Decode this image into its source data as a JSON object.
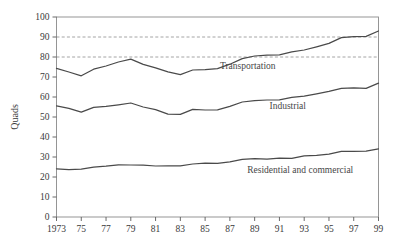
{
  "chart_data": {
    "type": "line",
    "title": "",
    "subtitle": "",
    "xlabel": "",
    "ylabel": "Quads",
    "xlim": [
      1973,
      1999
    ],
    "ylim": [
      0,
      100
    ],
    "grid": false,
    "legend_position": "inline-annotations",
    "x": [
      1973,
      1974,
      1975,
      1976,
      1977,
      1978,
      1979,
      1980,
      1981,
      1982,
      1983,
      1984,
      1985,
      1986,
      1987,
      1988,
      1989,
      1990,
      1991,
      1992,
      1993,
      1994,
      1995,
      1996,
      1997,
      1998,
      1999
    ],
    "x_tick_labels": [
      "1973",
      "75",
      "77",
      "79",
      "81",
      "83",
      "85",
      "87",
      "89",
      "91",
      "93",
      "95",
      "97",
      "99"
    ],
    "x_tick_values": [
      1973,
      1975,
      1977,
      1979,
      1981,
      1983,
      1985,
      1987,
      1989,
      1991,
      1993,
      1995,
      1997,
      1999
    ],
    "y_tick_labels": [
      "0",
      "10",
      "20",
      "30",
      "40",
      "50",
      "60",
      "70",
      "80",
      "90",
      "100"
    ],
    "y_tick_values": [
      0,
      10,
      20,
      30,
      40,
      50,
      60,
      70,
      80,
      90,
      100
    ],
    "series": [
      {
        "name": "Residential and commercial",
        "label": "Residential and commercial",
        "label_x": 1988.4,
        "label_y": 22.0,
        "color": "#4a4a4a",
        "values": [
          24.1,
          23.7,
          23.9,
          24.9,
          25.4,
          26.1,
          26.0,
          25.9,
          25.5,
          25.6,
          25.6,
          26.5,
          26.9,
          26.8,
          27.6,
          28.8,
          29.2,
          28.9,
          29.4,
          29.3,
          30.6,
          30.8,
          31.4,
          32.8,
          32.8,
          32.9,
          34.1
        ]
      },
      {
        "name": "Industrial",
        "label": "Industrial",
        "label_x": 1990.2,
        "label_y": 54.0,
        "color": "#4a4a4a",
        "values": [
          55.6,
          54.3,
          52.4,
          54.8,
          55.3,
          56.1,
          57.0,
          55.0,
          53.7,
          51.4,
          51.3,
          53.8,
          53.5,
          53.6,
          55.3,
          57.5,
          58.2,
          58.5,
          58.6,
          59.8,
          60.4,
          61.6,
          62.8,
          64.3,
          64.6,
          64.3,
          66.9
        ]
      },
      {
        "name": "Transportation",
        "label": "Transportation",
        "label_x": 1986.2,
        "label_y": 74.0,
        "color": "#4a4a4a",
        "values": [
          74.3,
          72.5,
          70.6,
          73.9,
          75.5,
          77.5,
          78.9,
          76.3,
          74.6,
          72.6,
          71.2,
          73.5,
          73.7,
          74.2,
          76.4,
          79.2,
          80.5,
          80.9,
          81.1,
          82.6,
          83.5,
          85.1,
          86.8,
          89.7,
          90.2,
          90.3,
          93.0
        ]
      }
    ],
    "reference_lines": [
      {
        "value": 90,
        "style": "dashed",
        "color": "#8d8d8d"
      },
      {
        "value": 80,
        "style": "dashed",
        "color": "#8d8d8d"
      }
    ],
    "annotations": [
      {
        "text": "Transportation",
        "x": 1986.2,
        "y": 74.0
      },
      {
        "text": "Industrial",
        "x": 1990.2,
        "y": 54.0
      },
      {
        "text": "Residential and commercial",
        "x": 1988.4,
        "y": 22.0
      }
    ]
  }
}
